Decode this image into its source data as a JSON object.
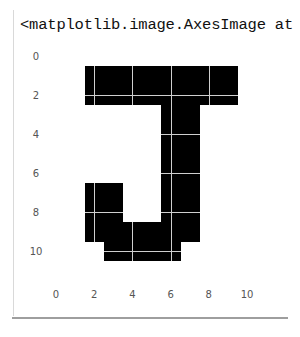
{
  "output": {
    "repr_text": "<matplotlib.image.AxesImage at"
  },
  "chart_data": {
    "type": "heatmap",
    "title": "",
    "xlabel": "",
    "ylabel": "",
    "cmap": "binary",
    "grid": true,
    "xticks": [
      0,
      2,
      4,
      6,
      8,
      10
    ],
    "yticks": [
      0,
      2,
      4,
      6,
      8,
      10
    ],
    "xlim": [
      -0.5,
      11.5
    ],
    "ylim": [
      11.5,
      -0.5
    ],
    "matrix": [
      [
        0,
        0,
        0,
        0,
        0,
        0,
        0,
        0,
        0,
        0,
        0,
        0
      ],
      [
        0,
        0,
        1,
        1,
        1,
        1,
        1,
        1,
        1,
        1,
        0,
        0
      ],
      [
        0,
        0,
        1,
        1,
        1,
        1,
        1,
        1,
        1,
        1,
        0,
        0
      ],
      [
        0,
        0,
        0,
        0,
        0,
        0,
        1,
        1,
        0,
        0,
        0,
        0
      ],
      [
        0,
        0,
        0,
        0,
        0,
        0,
        1,
        1,
        0,
        0,
        0,
        0
      ],
      [
        0,
        0,
        0,
        0,
        0,
        0,
        1,
        1,
        0,
        0,
        0,
        0
      ],
      [
        0,
        0,
        0,
        0,
        0,
        0,
        1,
        1,
        0,
        0,
        0,
        0
      ],
      [
        0,
        0,
        1,
        1,
        0,
        0,
        1,
        1,
        0,
        0,
        0,
        0
      ],
      [
        0,
        0,
        1,
        1,
        0,
        0,
        1,
        1,
        0,
        0,
        0,
        0
      ],
      [
        0,
        0,
        1,
        1,
        1,
        1,
        1,
        1,
        0,
        0,
        0,
        0
      ],
      [
        0,
        0,
        0,
        1,
        1,
        1,
        1,
        0,
        0,
        0,
        0,
        0
      ],
      [
        0,
        0,
        0,
        0,
        0,
        0,
        0,
        0,
        0,
        0,
        0,
        0
      ]
    ],
    "colors": {
      "on": "#000000",
      "off": "#ffffff",
      "grid": "#cfcfcf"
    }
  }
}
